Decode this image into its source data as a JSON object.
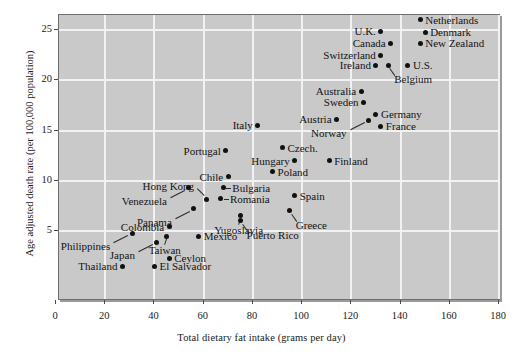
{
  "chart_data": {
    "type": "scatter",
    "title": "",
    "xlabel": "Total dietary fat intake (grams per day)",
    "ylabel": "Age adjusted death rate (per 100,000 population)",
    "xlim": [
      0,
      180
    ],
    "ylim": [
      0,
      26.5
    ],
    "xticks": [
      0,
      20,
      40,
      60,
      80,
      100,
      120,
      140,
      160,
      180
    ],
    "yticks": [
      5,
      10,
      15,
      20,
      25
    ],
    "grid": true,
    "legend": "none",
    "background_color": "#c9c9c9",
    "gridline_color": "#f2f2f2",
    "point_color": "#111111",
    "points": [
      {
        "name": "Thailand",
        "x": 27,
        "y": 1.5,
        "label_side": "left"
      },
      {
        "name": "El Salvador",
        "x": 40,
        "y": 1.5,
        "label_side": "right"
      },
      {
        "name": "Japan",
        "x": 41,
        "y": 3.9,
        "label_side": "leader-left"
      },
      {
        "name": "Philippines",
        "x": 31,
        "y": 4.8,
        "label_side": "leader-left"
      },
      {
        "name": "Ceylon",
        "x": 46,
        "y": 2.3,
        "label_side": "right"
      },
      {
        "name": "Taiwan",
        "x": 45,
        "y": 4.5,
        "label_side": "leader-down"
      },
      {
        "name": "Mexico",
        "x": 58,
        "y": 4.5,
        "label_side": "right"
      },
      {
        "name": "Colombia",
        "x": 46,
        "y": 5.4,
        "label_side": "left"
      },
      {
        "name": "Panama",
        "x": 56,
        "y": 7.2,
        "label_side": "leader-left"
      },
      {
        "name": "Venezuela",
        "x": 54,
        "y": 9.3,
        "label_side": "leader-left"
      },
      {
        "name": "Chile",
        "x": 70,
        "y": 10.4,
        "label_side": "left"
      },
      {
        "name": "Hong Kong",
        "x": 61,
        "y": 8.1,
        "label_side": "leader-up"
      },
      {
        "name": "Portugal",
        "x": 69,
        "y": 13.0,
        "label_side": "left"
      },
      {
        "name": "Bulgaria",
        "x": 68,
        "y": 9.3,
        "label_side": "leader-right"
      },
      {
        "name": "Romania",
        "x": 67,
        "y": 8.2,
        "label_side": "leader-right"
      },
      {
        "name": "Yugoslavia",
        "x": 75,
        "y": 6.5,
        "label_side": "leader-down"
      },
      {
        "name": "Puerto Rico",
        "x": 75,
        "y": 6.0,
        "label_side": "leader-down-right"
      },
      {
        "name": "Greece",
        "x": 95,
        "y": 7.0,
        "label_side": "leader-down-right"
      },
      {
        "name": "Spain",
        "x": 97,
        "y": 8.5,
        "label_side": "right"
      },
      {
        "name": "Poland",
        "x": 88,
        "y": 10.9,
        "label_side": "right"
      },
      {
        "name": "Hungary",
        "x": 97,
        "y": 12.0,
        "label_side": "left"
      },
      {
        "name": "Finland",
        "x": 111,
        "y": 12.0,
        "label_side": "right"
      },
      {
        "name": "Czech.",
        "x": 92,
        "y": 13.3,
        "label_side": "right"
      },
      {
        "name": "Italy",
        "x": 82,
        "y": 15.5,
        "label_side": "left"
      },
      {
        "name": "Norway",
        "x": 127,
        "y": 16.0,
        "label_side": "leader-left"
      },
      {
        "name": "Austria",
        "x": 114,
        "y": 16.1,
        "label_side": "left"
      },
      {
        "name": "Germany",
        "x": 130,
        "y": 16.6,
        "label_side": "right"
      },
      {
        "name": "France",
        "x": 132,
        "y": 15.4,
        "label_side": "right"
      },
      {
        "name": "Sweden",
        "x": 125,
        "y": 17.8,
        "label_side": "left"
      },
      {
        "name": "Australia",
        "x": 124,
        "y": 18.9,
        "label_side": "left"
      },
      {
        "name": "Ireland",
        "x": 130,
        "y": 21.5,
        "label_side": "left"
      },
      {
        "name": "Belgium",
        "x": 135,
        "y": 21.5,
        "label_side": "leader-down-right"
      },
      {
        "name": "U.S.",
        "x": 143,
        "y": 21.5,
        "label_side": "right"
      },
      {
        "name": "Switzerland",
        "x": 132,
        "y": 22.5,
        "label_side": "left"
      },
      {
        "name": "Canada",
        "x": 136,
        "y": 23.7,
        "label_side": "left"
      },
      {
        "name": "U.K.",
        "x": 132,
        "y": 24.9,
        "label_side": "left"
      },
      {
        "name": "New Zealand",
        "x": 148,
        "y": 23.7,
        "label_side": "right"
      },
      {
        "name": "Denmark",
        "x": 150,
        "y": 24.8,
        "label_side": "right"
      },
      {
        "name": "Netherlands",
        "x": 148,
        "y": 26.0,
        "label_side": "right"
      }
    ]
  },
  "axes": {
    "x_tick_labels": [
      "0",
      "20",
      "40",
      "60",
      "80",
      "100",
      "120",
      "140",
      "160",
      "180"
    ],
    "y_tick_labels": [
      "5",
      "10",
      "15",
      "20",
      "25"
    ],
    "x_title": "Total dietary fat intake (grams per day)",
    "y_title": "Age adjusted death rate (per 100,000 population)"
  }
}
